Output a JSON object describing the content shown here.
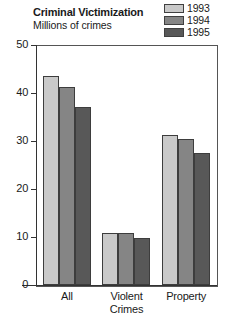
{
  "chart_data": {
    "type": "bar",
    "title": "Criminal Victimization",
    "subtitle": "Millions of crimes",
    "xlabel": "",
    "ylabel": "",
    "categories": [
      "All",
      "Violent Crimes",
      "Property"
    ],
    "category_lines": [
      [
        "All"
      ],
      [
        "Violent",
        "Crimes"
      ],
      [
        "Property"
      ]
    ],
    "series": [
      {
        "name": "1993",
        "color": "#c9c9c9",
        "values": [
          43.6,
          10.9,
          31.3
        ]
      },
      {
        "name": "1994",
        "color": "#858585",
        "values": [
          41.2,
          10.9,
          30.4
        ]
      },
      {
        "name": "1995",
        "color": "#585858",
        "values": [
          37.1,
          9.8,
          27.4
        ]
      }
    ],
    "ylim": [
      0,
      50
    ],
    "yticks": [
      0,
      10,
      20,
      30,
      40,
      50
    ],
    "ytick_labels": [
      "0",
      "10",
      "20",
      "30",
      "40",
      "50"
    ],
    "grid": false,
    "legend_position": "top-right",
    "frame_color": "#555555",
    "bar_edge_color": "#3d3d3d",
    "background": "#ffffff"
  },
  "legend": {
    "entries": [
      {
        "label": "1993",
        "color": "#c9c9c9"
      },
      {
        "label": "1994",
        "color": "#858585"
      },
      {
        "label": "1995",
        "color": "#585858"
      }
    ]
  }
}
